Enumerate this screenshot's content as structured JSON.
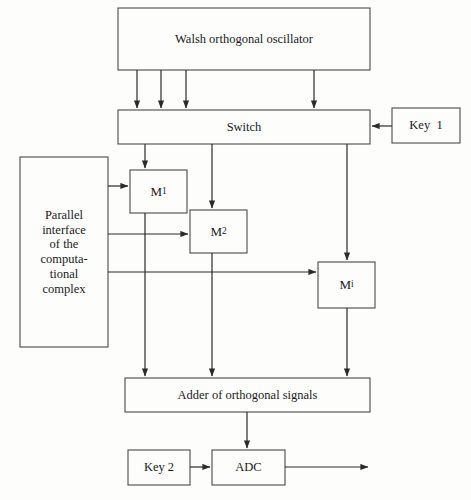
{
  "diagram": {
    "background_color": "#fdfdfc",
    "line_color": "#2b2b2b",
    "text_color": "#1a1a1a",
    "blocks": {
      "oscillator": {
        "label": "Walsh orthogonal oscillator"
      },
      "switch": {
        "label": "Switch"
      },
      "key1": {
        "label": "Key  1"
      },
      "parallel_interface": {
        "label": "Parallel\ninterface\nof the\ncomputa-\ntional\ncomplex"
      },
      "m1": {
        "label": "M",
        "subscript": "1"
      },
      "m2": {
        "label": "M",
        "subscript": "2"
      },
      "mi": {
        "label": "M",
        "subscript": "i"
      },
      "adder": {
        "label": "Adder of orthogonal signals"
      },
      "key2": {
        "label": "Key 2"
      },
      "adc": {
        "label": "ADC"
      }
    },
    "connections": [
      {
        "from": "oscillator",
        "to": "switch",
        "count": 4,
        "direction": "down"
      },
      {
        "from": "key1",
        "to": "switch",
        "direction": "left"
      },
      {
        "from": "switch",
        "to": "m1",
        "direction": "down"
      },
      {
        "from": "switch",
        "to": "m2",
        "direction": "down"
      },
      {
        "from": "switch",
        "to": "mi",
        "direction": "down"
      },
      {
        "from": "parallel_interface",
        "to": "m1",
        "direction": "right"
      },
      {
        "from": "parallel_interface",
        "to": "m2",
        "direction": "right"
      },
      {
        "from": "parallel_interface",
        "to": "mi",
        "direction": "right"
      },
      {
        "from": "m1",
        "to": "adder",
        "direction": "down"
      },
      {
        "from": "m2",
        "to": "adder",
        "direction": "down"
      },
      {
        "from": "mi",
        "to": "adder",
        "direction": "down"
      },
      {
        "from": "adder",
        "to": "adc",
        "direction": "down"
      },
      {
        "from": "key2",
        "to": "adc",
        "direction": "right"
      },
      {
        "from": "adc",
        "to": "output",
        "direction": "right"
      }
    ]
  }
}
